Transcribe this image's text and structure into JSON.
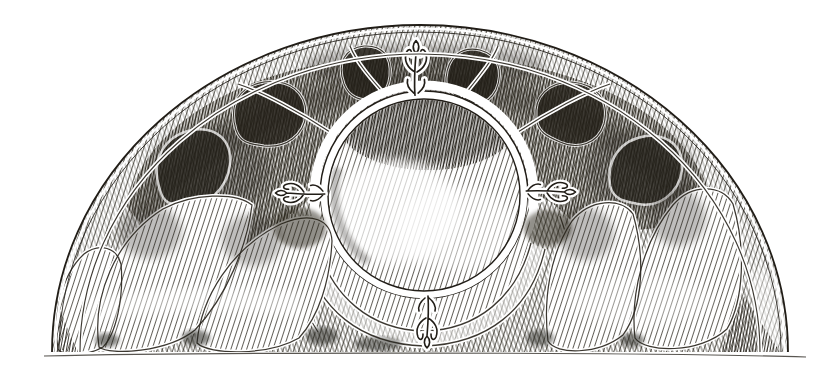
{
  "figure": {
    "kind": "engraving-illustration",
    "medium": "pen-and-ink line engraving on white paper",
    "alt": "Black-and-white engraving of a half-round lunette panel: dense diagonal hatching fills a semicircle edged by a double outline band; inside, a wreath of dark round-headed petals surrounds a central double-lined circle, lighter scalloped lobes rest on the flat baseline, and small leafy tuft ornaments sit at the top, bottom, left and right of the ring.",
    "colors": {
      "paper": "#ffffff",
      "ink": "#211d17",
      "hatch_light": "#47433b",
      "hatch_mid": "#37332b",
      "hatch_dark": "#2a261f"
    }
  }
}
